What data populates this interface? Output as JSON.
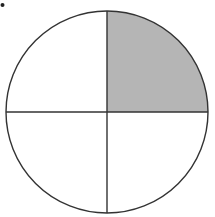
{
  "diagram": {
    "type": "fraction-circle",
    "total_parts": 4,
    "shaded_parts": 1,
    "shaded_quadrant": "top-right",
    "fraction_label": "1/4",
    "colors": {
      "stroke": "#333333",
      "shaded_fill": "#b5b5b5",
      "unshaded_fill": "#ffffff",
      "bullet": "#222222"
    }
  }
}
